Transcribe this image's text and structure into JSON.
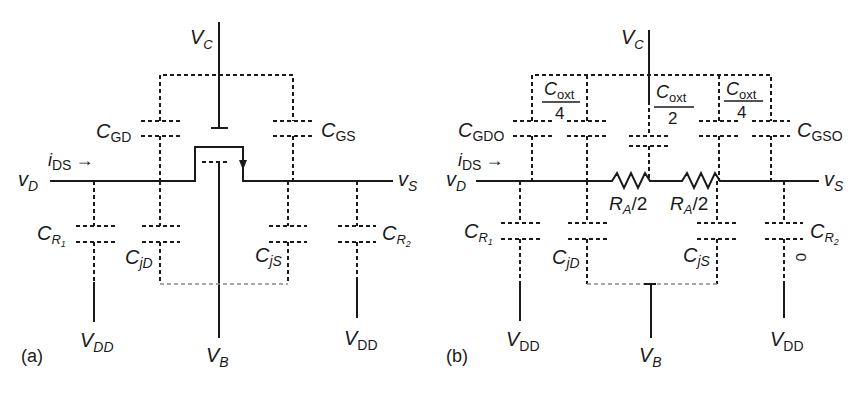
{
  "figure": {
    "panel_a": {
      "tag": "(a)",
      "gate_voltage": {
        "main": "V",
        "sub": "C"
      },
      "drain_node": {
        "main": "v",
        "sub": "D"
      },
      "source_node": {
        "main": "v",
        "sub": "S"
      },
      "current": {
        "main": "i",
        "sub": "DS",
        "arrow": "→"
      },
      "bulk_voltage": {
        "main": "V",
        "sub": "B"
      },
      "supply_left": {
        "main": "V",
        "sub": "DD"
      },
      "supply_right": {
        "main": "V",
        "sub": "DD"
      },
      "capacitors": {
        "cgd": {
          "main": "C",
          "sub": "GD"
        },
        "cgs": {
          "main": "C",
          "sub": "GS"
        },
        "cr1": {
          "main": "C",
          "sub": "R",
          "subsub": "1"
        },
        "cr2": {
          "main": "C",
          "sub": "R",
          "subsub": "2"
        },
        "cjd": {
          "main": "C",
          "sub": "jD"
        },
        "cjs": {
          "main": "C",
          "sub": "jS"
        }
      }
    },
    "panel_b": {
      "tag": "(b)",
      "gate_voltage": {
        "main": "V",
        "sub": "C"
      },
      "drain_node": {
        "main": "v",
        "sub": "D"
      },
      "source_node": {
        "main": "v",
        "sub": "S"
      },
      "current": {
        "main": "i",
        "sub": "DS",
        "arrow": "→"
      },
      "bulk_voltage": {
        "main": "V",
        "sub": "B"
      },
      "supply_left": {
        "main": "V",
        "sub": "DD"
      },
      "supply_right": {
        "main": "V",
        "sub": "DD"
      },
      "capacitors": {
        "cgdo": {
          "main": "C",
          "sub": "GDO"
        },
        "cgso": {
          "main": "C",
          "sub": "GSO"
        },
        "coxt_left": {
          "num_main": "C",
          "num_sub": "oxt",
          "den": "4"
        },
        "coxt_mid": {
          "num_main": "C",
          "num_sub": "oxt",
          "den": "2"
        },
        "coxt_right": {
          "num_main": "C",
          "num_sub": "oxt",
          "den": "4"
        },
        "cr1": {
          "main": "C",
          "sub": "R",
          "subsub": "1"
        },
        "cr2": {
          "main": "C",
          "sub": "R",
          "subsub": "2"
        },
        "cjd": {
          "main": "C",
          "sub": "jD"
        },
        "cjs": {
          "main": "C",
          "sub": "jS"
        },
        "zero_mark": "0"
      },
      "resistors": {
        "ra_left": {
          "main": "R",
          "sub": "A",
          "suffix": "/2"
        },
        "ra_right": {
          "main": "R",
          "sub": "A",
          "suffix": "/2"
        }
      }
    }
  }
}
